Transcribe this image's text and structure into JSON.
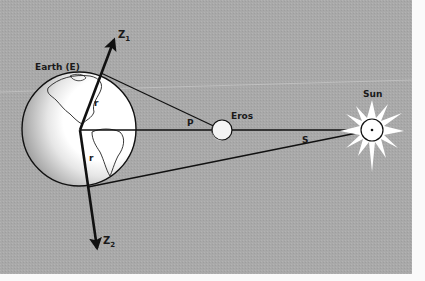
{
  "diagram": {
    "labels": {
      "earth": "Earth (E)",
      "eros": "Eros",
      "sun": "Sun",
      "z1": "Z",
      "z1_sub": "1",
      "z2": "Z",
      "z2_sub": "2",
      "r_top": "r",
      "r_bottom": "r",
      "p": "P",
      "s": "S"
    },
    "colors": {
      "background": "#a8a8a8",
      "paper": "#fafafa",
      "line": "#111111",
      "earth_light": "#ffffff",
      "earth_shadow": "#9a9a9a"
    }
  }
}
